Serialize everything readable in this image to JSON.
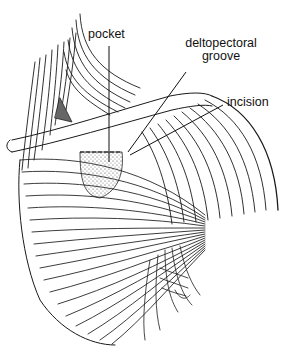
{
  "figure": {
    "colors": {
      "ink": "#111111",
      "background": "#ffffff",
      "stipple": "#555555"
    }
  },
  "labels": {
    "pocket": "pocket",
    "deltopectoral_groove_line1": "deltopectoral",
    "deltopectoral_groove_line2": "groove",
    "incision": "incision"
  }
}
